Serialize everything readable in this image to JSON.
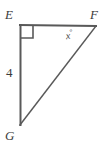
{
  "figure": {
    "type": "geometry-diagram",
    "background_color": "#ffffff",
    "stroke_color": "#595959",
    "text_color": "#3b3b3b",
    "stroke_width": 2,
    "vertices": [
      {
        "name": "E",
        "label": "E",
        "x": 20,
        "y": 25
      },
      {
        "name": "F",
        "label": "F",
        "x": 96,
        "y": 26
      },
      {
        "name": "G",
        "label": "G",
        "x": 20,
        "y": 125
      }
    ],
    "sides": [
      {
        "name": "EF",
        "from": "E",
        "to": "F",
        "label": ""
      },
      {
        "name": "EG",
        "from": "E",
        "to": "G",
        "label": "4"
      },
      {
        "name": "GF",
        "from": "G",
        "to": "F",
        "label": ""
      }
    ],
    "angles": [
      {
        "name": "angle-E",
        "at": "E",
        "marker": "right-angle-square",
        "label": ""
      },
      {
        "name": "angle-F",
        "at": "F",
        "marker": "none",
        "label": "x",
        "degree_symbol": "°"
      }
    ],
    "right_angle_marker": {
      "x": 21,
      "y": 26,
      "size": 12
    },
    "labels": {
      "vertex_E": "E",
      "vertex_F": "F",
      "vertex_G": "G",
      "side_EG": "4",
      "angle_F_variable": "x",
      "degree_symbol": "°"
    }
  }
}
